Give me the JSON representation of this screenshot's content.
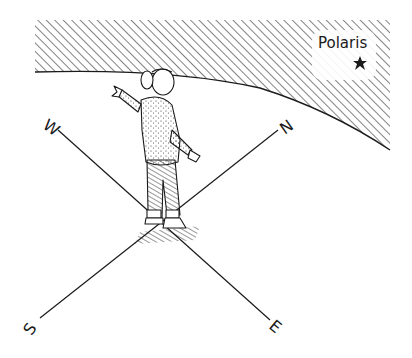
{
  "illustration": {
    "sky_label": "Polaris",
    "directions": {
      "north": "N",
      "south": "S",
      "east": "E",
      "west": "W"
    },
    "figure": "girl-standing-arms-outstretched",
    "colors": {
      "ink": "#1a1a1a",
      "background": "#ffffff"
    }
  }
}
